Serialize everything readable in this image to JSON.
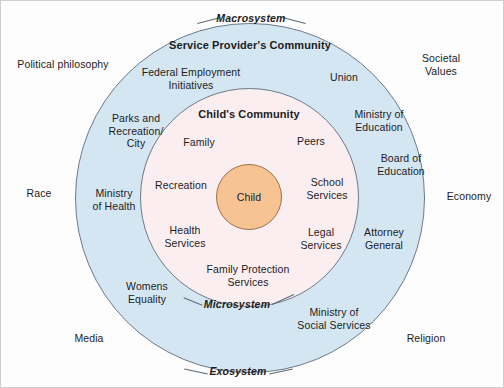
{
  "diagram": {
    "colors": {
      "macro_fill": "#d5e6f3",
      "micro_fill": "#fbeef0",
      "child_fill": "#f7c393",
      "stroke": "#6c7a86",
      "text": "#1c1c22",
      "frame": "#cfcfcf"
    },
    "system_labels": {
      "macrosystem": "Macrosystem",
      "exosystem": "Exosystem",
      "microsystem": "Microsystem"
    },
    "ring_titles": {
      "service_provider_community": "Service Provider's Community",
      "childs_community": "Child's Community"
    },
    "center": {
      "label": "Child"
    },
    "macro_outside_labels": [
      {
        "label": "Political philosophy",
        "x": 62,
        "y": 63
      },
      {
        "label": "Societal Values",
        "x": 440,
        "y": 63
      },
      {
        "label": "Race",
        "x": 38,
        "y": 192
      },
      {
        "label": "Economy",
        "x": 468,
        "y": 195
      },
      {
        "label": "Media",
        "x": 88,
        "y": 337
      },
      {
        "label": "Religion",
        "x": 425,
        "y": 337
      }
    ],
    "service_provider_labels": [
      {
        "label": "Federal Employment\nInitiatives",
        "x": 190,
        "y": 77
      },
      {
        "label": "Union",
        "x": 343,
        "y": 76
      },
      {
        "label": "Parks and\nRecreation/\nCity",
        "x": 135,
        "y": 130
      },
      {
        "label": "Ministry of\nEducation",
        "x": 378,
        "y": 119
      },
      {
        "label": "Board of\nEducation",
        "x": 400,
        "y": 163
      },
      {
        "label": "Ministry\nof Health",
        "x": 113,
        "y": 198
      },
      {
        "label": "Attorney\nGeneral",
        "x": 383,
        "y": 237
      },
      {
        "label": "Womens\nEquality",
        "x": 146,
        "y": 291
      },
      {
        "label": "Ministry of\nSocial Services",
        "x": 333,
        "y": 317
      }
    ],
    "childs_community_labels": [
      {
        "label": "Family",
        "x": 198,
        "y": 141
      },
      {
        "label": "Peers",
        "x": 310,
        "y": 140
      },
      {
        "label": "Recreation",
        "x": 180,
        "y": 184
      },
      {
        "label": "School\nServices",
        "x": 326,
        "y": 187
      },
      {
        "label": "Health\nServices",
        "x": 184,
        "y": 235
      },
      {
        "label": "Legal\nServices",
        "x": 320,
        "y": 237
      },
      {
        "label": "Family Protection\nServices",
        "x": 247,
        "y": 274
      }
    ]
  }
}
